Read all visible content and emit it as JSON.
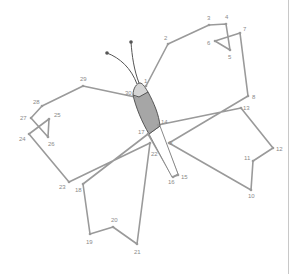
{
  "diagram": {
    "colors": {
      "line": "#9a9a9a",
      "body_fill": "#a6a6a6",
      "head_fill": "#d4d4d4",
      "outline": "#555555",
      "label": "#8a8a8a",
      "divider": "#c8c8c8"
    },
    "points": [
      {
        "n": "1",
        "x": 146,
        "y": 86,
        "lx": 144,
        "ly": 83
      },
      {
        "n": "2",
        "x": 168,
        "y": 44,
        "lx": 164,
        "ly": 40
      },
      {
        "n": "3",
        "x": 209,
        "y": 25,
        "lx": 207,
        "ly": 20
      },
      {
        "n": "4",
        "x": 226,
        "y": 24,
        "lx": 225,
        "ly": 19
      },
      {
        "n": "5",
        "x": 230,
        "y": 50,
        "lx": 228,
        "ly": 59
      },
      {
        "n": "6",
        "x": 215,
        "y": 41,
        "lx": 207,
        "ly": 45
      },
      {
        "n": "7",
        "x": 240,
        "y": 33,
        "lx": 243,
        "ly": 31
      },
      {
        "n": "8",
        "x": 248,
        "y": 96,
        "lx": 252,
        "ly": 99
      },
      {
        "n": "9",
        "x": 169,
        "y": 143,
        "lx": 169,
        "ly": 145
      },
      {
        "n": "10",
        "x": 251,
        "y": 190,
        "lx": 248,
        "ly": 198
      },
      {
        "n": "11",
        "x": 253,
        "y": 161,
        "lx": 244,
        "ly": 160
      },
      {
        "n": "12",
        "x": 273,
        "y": 148,
        "lx": 276,
        "ly": 151
      },
      {
        "n": "13",
        "x": 241,
        "y": 108,
        "lx": 243,
        "ly": 110
      },
      {
        "n": "14",
        "x": 158,
        "y": 125,
        "lx": 161,
        "ly": 124
      },
      {
        "n": "15",
        "x": 178,
        "y": 175,
        "lx": 181,
        "ly": 179
      },
      {
        "n": "16",
        "x": 173,
        "y": 177,
        "lx": 168,
        "ly": 184
      },
      {
        "n": "17",
        "x": 148,
        "y": 134,
        "lx": 138,
        "ly": 134
      },
      {
        "n": "18",
        "x": 83,
        "y": 184,
        "lx": 75,
        "ly": 192
      },
      {
        "n": "19",
        "x": 90,
        "y": 234,
        "lx": 86,
        "ly": 244
      },
      {
        "n": "20",
        "x": 113,
        "y": 227,
        "lx": 111,
        "ly": 222
      },
      {
        "n": "21",
        "x": 137,
        "y": 244,
        "lx": 134,
        "ly": 254
      },
      {
        "n": "22",
        "x": 150,
        "y": 143,
        "lx": 151,
        "ly": 156
      },
      {
        "n": "23",
        "x": 69,
        "y": 182,
        "lx": 59,
        "ly": 189
      },
      {
        "n": "24",
        "x": 29,
        "y": 134,
        "lx": 19,
        "ly": 141
      },
      {
        "n": "25",
        "x": 49,
        "y": 119,
        "lx": 54,
        "ly": 117
      },
      {
        "n": "26",
        "x": 48,
        "y": 137,
        "lx": 48,
        "ly": 146
      },
      {
        "n": "27",
        "x": 31,
        "y": 118,
        "lx": 20,
        "ly": 120
      },
      {
        "n": "28",
        "x": 42,
        "y": 106,
        "lx": 33,
        "ly": 104
      },
      {
        "n": "29",
        "x": 83,
        "y": 86,
        "lx": 80,
        "ly": 81
      },
      {
        "n": "30",
        "x": 135,
        "y": 97,
        "lx": 125,
        "ly": 95
      }
    ],
    "body": {
      "head_path": "M133,95 C133,88 137,83 140,83 C143,83 146,89 148,92 L139,97 Z",
      "abdomen_path": "M133,95 L148,92 C154,103 159,115 160,126 L149,134 C142,122 136,108 133,95 Z",
      "tail_path": "M149,134 L160,126 L178,174 L172,177 Z"
    },
    "antennae": [
      {
        "path": "M137,84 C131,68 120,58 107,53",
        "tip_x": 107,
        "tip_y": 53
      },
      {
        "path": "M139,83 C134,70 132,56 131,42",
        "tip_x": 131,
        "tip_y": 42
      }
    ]
  }
}
